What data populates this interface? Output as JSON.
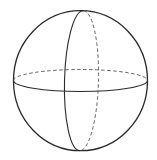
{
  "diagram": {
    "type": "sphere-wireframe",
    "stroke_color": "#2a2a2a",
    "dashed_color": "#555555",
    "background": "#ffffff",
    "outline": {
      "cx": 80.5,
      "cy": 80.7,
      "rx": 67,
      "ry": 70
    },
    "equator": {
      "cx": 80.5,
      "cy": 80.5,
      "rx": 67,
      "ry": 11,
      "front": "solid",
      "back": "dashed"
    },
    "meridian": {
      "cx": 81.5,
      "cy": 80.7,
      "rx": 17,
      "ry": 70,
      "rotate": 1.5,
      "front": "solid",
      "back": "dashed"
    }
  }
}
